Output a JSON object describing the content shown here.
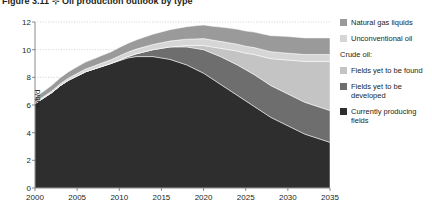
{
  "figure": {
    "title_clipped": "Figure 3.11 ⊹ Oil production outlook by type",
    "ylabel": "mb/d"
  },
  "legend": {
    "items_top": [
      {
        "label": "Natural gas liquids",
        "color": "#9a9a9a",
        "key": "ngl"
      },
      {
        "label": "Unconventional oil",
        "color": "#d6d6d6",
        "key": "unconventional"
      }
    ],
    "group_label": "Crude oil:",
    "items_crude": [
      {
        "label": "Fields yet to be found",
        "color": "#c4c4c4",
        "key": "yet_to_be_found"
      },
      {
        "label": "Fields yet to be developed",
        "color": "#6e6e6e",
        "key": "yet_to_be_developed"
      },
      {
        "label": "Currently producing fields",
        "color": "#2e2e2e",
        "key": "currently_producing"
      }
    ]
  },
  "axes": {
    "y_ticks": [
      "0",
      "2",
      "4",
      "6",
      "8",
      "10",
      "12"
    ],
    "x_ticks": [
      "2000",
      "2005",
      "2010",
      "2015",
      "2020",
      "2025",
      "2030",
      "2035"
    ]
  },
  "chart_data": {
    "type": "area",
    "title": "Oil production outlook by type",
    "xlabel": "",
    "ylabel": "mb/d",
    "xlim": [
      2000,
      2035
    ],
    "ylim": [
      0,
      12
    ],
    "y_ticks": [
      0,
      2,
      4,
      6,
      8,
      10,
      12
    ],
    "x_ticks": [
      2000,
      2005,
      2010,
      2015,
      2020,
      2025,
      2030,
      2035
    ],
    "grid": "horizontal-dotted",
    "legend_position": "right",
    "stacked": true,
    "x": [
      2000,
      2001,
      2002,
      2003,
      2004,
      2005,
      2006,
      2007,
      2008,
      2009,
      2010,
      2011,
      2012,
      2013,
      2014,
      2015,
      2016,
      2017,
      2018,
      2019,
      2020,
      2021,
      2022,
      2023,
      2024,
      2025,
      2026,
      2027,
      2028,
      2029,
      2030,
      2031,
      2032,
      2033,
      2034,
      2035
    ],
    "series": [
      {
        "name": "Currently producing fields",
        "color": "#2e2e2e",
        "values": [
          6.1,
          6.5,
          6.9,
          7.4,
          7.8,
          8.1,
          8.4,
          8.6,
          8.8,
          9.0,
          9.2,
          9.4,
          9.5,
          9.5,
          9.5,
          9.4,
          9.3,
          9.1,
          8.9,
          8.6,
          8.3,
          7.9,
          7.5,
          7.1,
          6.7,
          6.3,
          5.9,
          5.5,
          5.1,
          4.8,
          4.5,
          4.2,
          3.9,
          3.7,
          3.5,
          3.3
        ]
      },
      {
        "name": "Fields yet to be developed",
        "color": "#6e6e6e",
        "values": [
          0.0,
          0.0,
          0.0,
          0.0,
          0.0,
          0.0,
          0.0,
          0.0,
          0.0,
          0.0,
          0.05,
          0.1,
          0.2,
          0.35,
          0.5,
          0.7,
          0.9,
          1.1,
          1.3,
          1.5,
          1.7,
          1.85,
          2.0,
          2.1,
          2.2,
          2.25,
          2.3,
          2.3,
          2.3,
          2.3,
          2.3,
          2.3,
          2.3,
          2.3,
          2.3,
          2.3
        ]
      },
      {
        "name": "Fields yet to be found",
        "color": "#c4c4c4",
        "values": [
          0.0,
          0.0,
          0.0,
          0.0,
          0.0,
          0.0,
          0.0,
          0.0,
          0.0,
          0.0,
          0.0,
          0.0,
          0.0,
          0.0,
          0.0,
          0.0,
          0.0,
          0.05,
          0.1,
          0.2,
          0.3,
          0.45,
          0.6,
          0.8,
          1.0,
          1.2,
          1.45,
          1.7,
          1.95,
          2.2,
          2.45,
          2.7,
          2.95,
          3.15,
          3.35,
          3.55
        ]
      },
      {
        "name": "Unconventional oil",
        "color": "#d6d6d6",
        "values": [
          0.1,
          0.1,
          0.12,
          0.14,
          0.16,
          0.18,
          0.2,
          0.22,
          0.25,
          0.27,
          0.3,
          0.32,
          0.34,
          0.36,
          0.38,
          0.4,
          0.42,
          0.44,
          0.46,
          0.48,
          0.5,
          0.5,
          0.5,
          0.5,
          0.5,
          0.5,
          0.5,
          0.5,
          0.5,
          0.5,
          0.5,
          0.5,
          0.5,
          0.5,
          0.5,
          0.5
        ]
      },
      {
        "name": "Natural gas liquids",
        "color": "#9a9a9a",
        "values": [
          0.35,
          0.38,
          0.4,
          0.43,
          0.45,
          0.48,
          0.5,
          0.52,
          0.55,
          0.57,
          0.6,
          0.63,
          0.66,
          0.7,
          0.74,
          0.78,
          0.82,
          0.86,
          0.9,
          0.94,
          0.98,
          1.0,
          1.03,
          1.06,
          1.08,
          1.1,
          1.12,
          1.14,
          1.16,
          1.18,
          1.2,
          1.2,
          1.2,
          1.2,
          1.2,
          1.2
        ]
      }
    ]
  }
}
